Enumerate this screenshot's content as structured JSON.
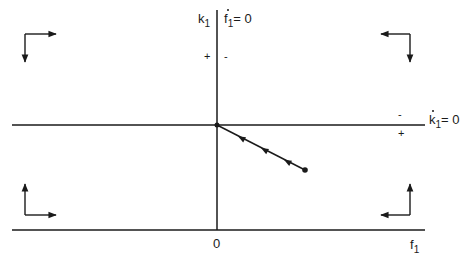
{
  "diagram": {
    "type": "phase-diagram",
    "colors": {
      "ink": "#1a1a1a",
      "background": "#ffffff"
    },
    "axes": {
      "vertical": {
        "label_var": "k",
        "label_sub": "1"
      },
      "horizontal": {
        "label_var": "f",
        "label_sub": "1",
        "origin_label": "0"
      }
    },
    "isoclines": [
      {
        "name": "f1-dot-zero",
        "var": "f",
        "sub": "1",
        "rhs": "= 0",
        "signs": {
          "left": "+",
          "right": "-"
        }
      },
      {
        "name": "k1-dot-zero",
        "var": "k",
        "sub": "1",
        "rhs": "= 0",
        "signs": {
          "above": "-",
          "below": "+"
        }
      }
    ],
    "trajectory": {
      "start": [
        305,
        170
      ],
      "end": [
        217,
        125
      ],
      "arrow_count": 3,
      "direction": "toward origin"
    },
    "quadrant_arrows": [
      {
        "quadrant": "top-left",
        "horizontal": "right",
        "vertical": "down"
      },
      {
        "quadrant": "top-right",
        "horizontal": "left",
        "vertical": "down"
      },
      {
        "quadrant": "bottom-left",
        "horizontal": "right",
        "vertical": "up"
      },
      {
        "quadrant": "bottom-right",
        "horizontal": "left",
        "vertical": "up"
      }
    ]
  }
}
